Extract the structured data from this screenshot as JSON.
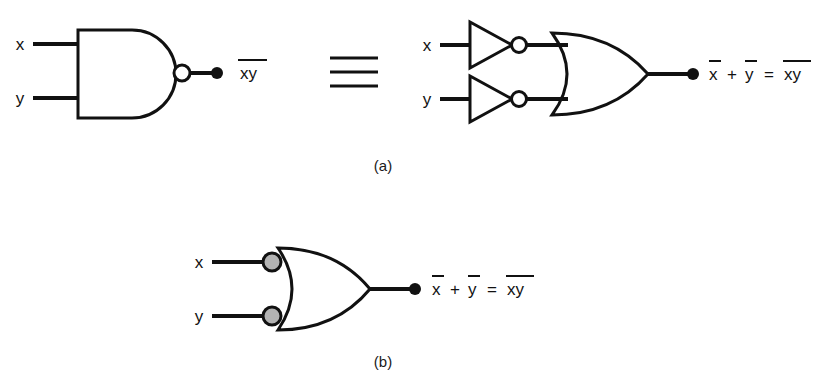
{
  "figure": {
    "background_color": "#ffffff",
    "ink_color": "#111111",
    "bubble_fill_color": "#b3b3b3"
  },
  "panel_a": {
    "caption": "(a)",
    "nand": {
      "gate_type": "nand-gate",
      "inputs": [
        {
          "label": "x"
        },
        {
          "label": "y"
        }
      ],
      "output_label": "xy",
      "output_overbar": "full"
    },
    "equivalence_symbol": "≡",
    "or_network": {
      "gate_type": "or-gate",
      "inverters": [
        {
          "gate_type": "not-gate",
          "input_label": "x"
        },
        {
          "gate_type": "not-gate",
          "input_label": "y"
        }
      ],
      "inputs": [
        {
          "label": "x"
        },
        {
          "label": "y"
        }
      ],
      "output_expression": {
        "term1": "x",
        "operator_plus": "+",
        "term2": "y",
        "operator_equals": "=",
        "term3": "xy"
      }
    }
  },
  "panel_b": {
    "caption": "(b)",
    "or_gate_inverted_inputs": {
      "gate_type": "or-gate-inverted-inputs",
      "inputs": [
        {
          "label": "x",
          "bubble": true
        },
        {
          "label": "y",
          "bubble": true
        }
      ],
      "output_expression": {
        "term1": "x",
        "operator_plus": "+",
        "term2": "y",
        "operator_equals": "=",
        "term3": "xy"
      }
    }
  }
}
